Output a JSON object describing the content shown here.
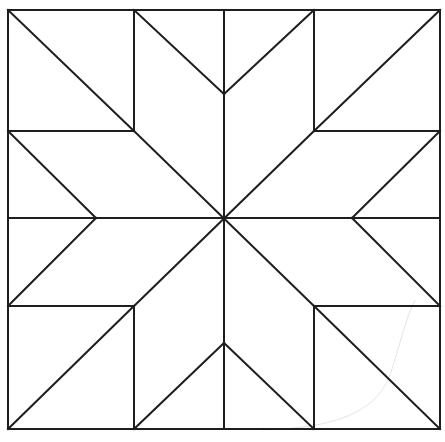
{
  "diagram": {
    "title": "",
    "type": "quilt-block-eight-point-star",
    "stroke_color": "#1e1e1e",
    "background": "#ffffff",
    "bounds": {
      "left": 8,
      "top": 10,
      "right": 440,
      "bottom": 429
    },
    "grid": {
      "columns_x": [
        8,
        134,
        224,
        314,
        440
      ],
      "rows_y": [
        10,
        131,
        218,
        306,
        429
      ]
    },
    "segments": [
      {
        "id": "top-left-corner-diagonal",
        "x1": 8,
        "y1": 10,
        "x2": 134,
        "y2": 131
      },
      {
        "id": "top-right-corner-diagonal",
        "x1": 440,
        "y1": 10,
        "x2": 314,
        "y2": 131
      },
      {
        "id": "bottom-left-corner-diagonal",
        "x1": 8,
        "y1": 429,
        "x2": 134,
        "y2": 306
      },
      {
        "id": "bottom-right-corner-diagonal",
        "x1": 440,
        "y1": 429,
        "x2": 314,
        "y2": 306
      },
      {
        "id": "top-left-square-right",
        "x1": 134,
        "y1": 10,
        "x2": 134,
        "y2": 131
      },
      {
        "id": "top-left-square-bottom",
        "x1": 8,
        "y1": 131,
        "x2": 134,
        "y2": 131
      },
      {
        "id": "top-right-square-left",
        "x1": 314,
        "y1": 10,
        "x2": 314,
        "y2": 131
      },
      {
        "id": "top-right-square-bottom",
        "x1": 314,
        "y1": 131,
        "x2": 440,
        "y2": 131
      },
      {
        "id": "bottom-left-square-right",
        "x1": 134,
        "y1": 306,
        "x2": 134,
        "y2": 429
      },
      {
        "id": "bottom-left-square-top",
        "x1": 8,
        "y1": 306,
        "x2": 134,
        "y2": 306
      },
      {
        "id": "bottom-right-square-left",
        "x1": 314,
        "y1": 306,
        "x2": 314,
        "y2": 429
      },
      {
        "id": "bottom-right-square-top",
        "x1": 314,
        "y1": 306,
        "x2": 440,
        "y2": 306
      },
      {
        "id": "vertical-center",
        "x1": 224,
        "y1": 10,
        "x2": 224,
        "y2": 429
      },
      {
        "id": "horizontal-center",
        "x1": 8,
        "y1": 218,
        "x2": 440,
        "y2": 218
      },
      {
        "id": "main-diagonal-a",
        "x1": 134,
        "y1": 131,
        "x2": 314,
        "y2": 306
      },
      {
        "id": "main-diagonal-b",
        "x1": 314,
        "y1": 131,
        "x2": 134,
        "y2": 306
      },
      {
        "id": "top-v-left",
        "x1": 134,
        "y1": 10,
        "x2": 224,
        "y2": 94
      },
      {
        "id": "top-v-right",
        "x1": 314,
        "y1": 10,
        "x2": 224,
        "y2": 94
      },
      {
        "id": "bottom-v-left",
        "x1": 134,
        "y1": 429,
        "x2": 224,
        "y2": 343
      },
      {
        "id": "bottom-v-right",
        "x1": 314,
        "y1": 429,
        "x2": 224,
        "y2": 343
      },
      {
        "id": "left-v-top",
        "x1": 8,
        "y1": 131,
        "x2": 96,
        "y2": 218
      },
      {
        "id": "left-v-bottom",
        "x1": 8,
        "y1": 306,
        "x2": 96,
        "y2": 218
      },
      {
        "id": "right-v-top",
        "x1": 440,
        "y1": 131,
        "x2": 352,
        "y2": 218
      },
      {
        "id": "right-v-bottom",
        "x1": 440,
        "y1": 306,
        "x2": 352,
        "y2": 218
      }
    ]
  }
}
